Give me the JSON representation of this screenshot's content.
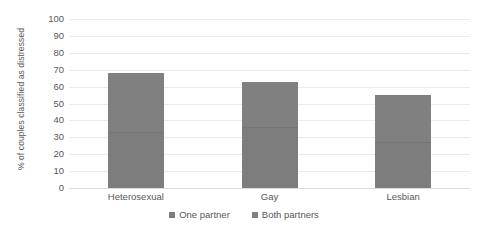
{
  "chart_data": {
    "type": "bar",
    "subtype": "stacked-bar",
    "title": "",
    "xlabel": "",
    "ylabel": "% of couples classified as distressed",
    "ylim": [
      0,
      100
    ],
    "ytick_step": 10,
    "yticks": [
      100,
      90,
      80,
      70,
      60,
      50,
      40,
      30,
      20,
      10,
      0
    ],
    "grid": true,
    "legend_position": "bottom",
    "categories": [
      "Heterosexual",
      "Gay",
      "Lesbian"
    ],
    "series": [
      {
        "name": "One partner",
        "values": [
          33,
          36,
          27
        ]
      },
      {
        "name": "Both partners",
        "values": [
          35,
          27,
          28
        ]
      }
    ],
    "totals": [
      68,
      63,
      55
    ],
    "colors": {
      "one_partner": "#7d7d7d",
      "both_partners": "#808080",
      "gridline": "#eceaea",
      "axis_text": "#585858",
      "background": "#ffffff"
    }
  },
  "legend": {
    "items": [
      {
        "label": "One partner"
      },
      {
        "label": "Both partners"
      }
    ]
  }
}
